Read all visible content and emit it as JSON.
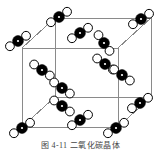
{
  "figure": {
    "caption": "图 4-11  二氧化碳晶体",
    "caption_number": "4-11",
    "caption_title": "二氧化碳晶体",
    "background_color": "#ffffff"
  },
  "legend": {
    "carbon_label": "C",
    "oxygen_label": "O",
    "carbon_color": "#000000",
    "oxygen_color": "#ffffff",
    "outline_color": "#000000",
    "bond_color": "#000000",
    "cell_edge_color": "#8a8a8a"
  },
  "chart_data": {
    "type": "diagram",
    "title": "二氧化碳晶体",
    "structure": "face-centered cubic (FCC) molecular crystal of CO2",
    "atom_types": [
      {
        "name": "carbon",
        "symbol": "C",
        "fill": "#000000",
        "radius": 5.4,
        "has_center_dot": true
      },
      {
        "name": "oxygen",
        "symbol": "O",
        "fill": "#ffffff",
        "radius": 4.4,
        "has_center_dot": false
      }
    ],
    "unit_cell": {
      "projection": "oblique",
      "front_face": {
        "x": 22,
        "y": 48,
        "w": 96,
        "h": 79
      },
      "depth_dx": 33,
      "depth_dy": -30,
      "edge_color": "#8a8a8a",
      "edge_width": 1
    },
    "molecules": [
      {
        "id": "m1",
        "site": "corner-back-top-left",
        "cx": 18,
        "cy": 41,
        "angle": -33
      },
      {
        "id": "m2",
        "site": "corner-back-top-right",
        "cx": 141,
        "cy": 19,
        "angle": -33
      },
      {
        "id": "m3",
        "site": "face-top-center",
        "cx": 59,
        "cy": 17,
        "angle": -33
      },
      {
        "id": "m4",
        "site": "face-top-inner",
        "cx": 80,
        "cy": 33,
        "angle": -33
      },
      {
        "id": "m5",
        "site": "face-right-upper",
        "cx": 104,
        "cy": 43,
        "angle": 55
      },
      {
        "id": "m6",
        "site": "face-right-mid",
        "cx": 105,
        "cy": 64,
        "angle": 35
      },
      {
        "id": "m7",
        "site": "face-right-lower",
        "cx": 122,
        "cy": 75,
        "angle": 35
      },
      {
        "id": "m8",
        "site": "face-left-upper",
        "cx": 42,
        "cy": 70,
        "angle": 35
      },
      {
        "id": "m9",
        "site": "face-center-left",
        "cx": 62,
        "cy": 88,
        "angle": 35
      },
      {
        "id": "m10",
        "site": "face-center-lower",
        "cx": 62,
        "cy": 106,
        "angle": 35
      },
      {
        "id": "m11",
        "site": "face-bottom-center",
        "cx": 80,
        "cy": 120,
        "angle": -33
      },
      {
        "id": "m12",
        "site": "corner-front-bottom-left",
        "cx": 22,
        "cy": 128,
        "angle": -33
      },
      {
        "id": "m13",
        "site": "corner-front-bottom-right",
        "cx": 116,
        "cy": 128,
        "angle": -33
      },
      {
        "id": "m14",
        "site": "corner-back-bottom-right",
        "cx": 140,
        "cy": 103,
        "angle": -33
      }
    ]
  }
}
